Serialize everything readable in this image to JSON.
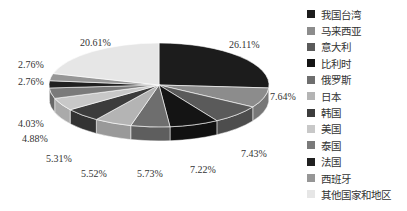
{
  "chart_data": {
    "type": "pie",
    "style": "3d",
    "title": "",
    "legend_position": "right",
    "categories": [
      "我国台湾",
      "马来西亚",
      "意大利",
      "比利时",
      "俄罗斯",
      "日本",
      "韩国",
      "美国",
      "泰国",
      "法国",
      "西班牙",
      "其他国家和地区"
    ],
    "values": [
      26.11,
      7.64,
      7.43,
      7.22,
      5.73,
      5.52,
      5.31,
      4.88,
      4.03,
      2.76,
      2.76,
      20.61
    ],
    "labels": [
      "26.11%",
      "7.64%",
      "7.43%",
      "7.22%",
      "5.73%",
      "5.52%",
      "5.31%",
      "4.88%",
      "4.03%",
      "2.76%",
      "2.76%",
      "20.61%"
    ],
    "colors": [
      "#1c1c1c",
      "#8c8c8c",
      "#5a5a5a",
      "#141414",
      "#6e6e6e",
      "#b4b4b4",
      "#3c3c3c",
      "#c8c8c8",
      "#7a7a7a",
      "#202020",
      "#969696",
      "#e6e6e6"
    ]
  },
  "legend": {
    "items": [
      {
        "label": "我国台湾",
        "color": "#1c1c1c"
      },
      {
        "label": "马来西亚",
        "color": "#8c8c8c"
      },
      {
        "label": "意大利",
        "color": "#5a5a5a"
      },
      {
        "label": "比利时",
        "color": "#141414"
      },
      {
        "label": "俄罗斯",
        "color": "#6e6e6e"
      },
      {
        "label": "日本",
        "color": "#b4b4b4"
      },
      {
        "label": "韩国",
        "color": "#3c3c3c"
      },
      {
        "label": "美国",
        "color": "#c8c8c8"
      },
      {
        "label": "泰国",
        "color": "#7a7a7a"
      },
      {
        "label": "法国",
        "color": "#202020"
      },
      {
        "label": "西班牙",
        "color": "#969696"
      },
      {
        "label": "其他国家和地区",
        "color": "#e6e6e6"
      }
    ]
  },
  "label_positions": [
    {
      "x": 229,
      "y": 48
    },
    {
      "x": 270,
      "y": 100
    },
    {
      "x": 241,
      "y": 157
    },
    {
      "x": 190,
      "y": 173
    },
    {
      "x": 137,
      "y": 177
    },
    {
      "x": 81,
      "y": 177
    },
    {
      "x": 46,
      "y": 162
    },
    {
      "x": 22,
      "y": 142
    },
    {
      "x": 18,
      "y": 127
    },
    {
      "x": 18,
      "y": 85
    },
    {
      "x": 18,
      "y": 68
    },
    {
      "x": 80,
      "y": 46
    }
  ]
}
